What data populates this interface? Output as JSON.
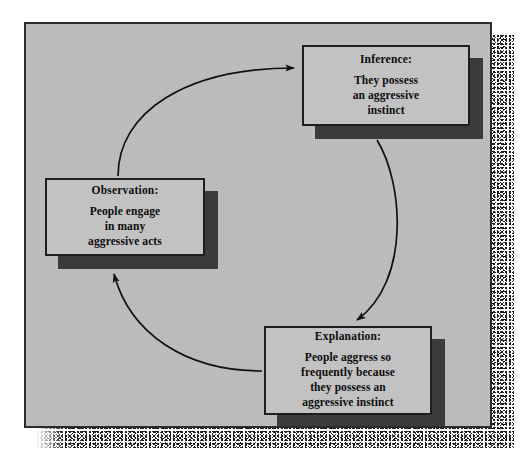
{
  "diagram": {
    "background_color": "#bdbdbd",
    "box_face_color": "#c2c2c2",
    "box_shadow_color": "#3b3b3b",
    "border_color": "#1e1e1e",
    "nodes": [
      {
        "id": "inference",
        "title": "Inference:",
        "lines": [
          "They possess",
          "an aggressive",
          "instinct"
        ]
      },
      {
        "id": "observation",
        "title": "Observation:",
        "lines": [
          "People engage",
          "in many",
          "aggressive acts"
        ]
      },
      {
        "id": "explanation",
        "title": "Explanation:",
        "lines": [
          "People aggress so",
          "frequently because",
          "they possess an",
          "aggressive instinct"
        ]
      }
    ],
    "arrows": [
      {
        "id": "observation-to-inference",
        "from": "observation",
        "to": "inference"
      },
      {
        "id": "inference-to-explanation",
        "from": "inference",
        "to": "explanation"
      },
      {
        "id": "explanation-to-observation",
        "from": "explanation",
        "to": "observation"
      }
    ]
  }
}
